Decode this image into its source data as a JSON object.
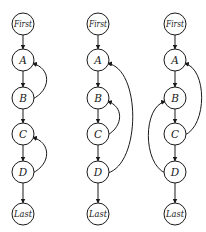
{
  "diagram": {
    "type": "control-flow-graphs",
    "colors": {
      "stroke": "#1a1a1a",
      "node_fill": "#ffffff",
      "background": "#ffffff"
    },
    "node_radius": 11,
    "graphs": [
      {
        "id": "graph-1",
        "cx": 23,
        "nodes": [
          {
            "id": "first",
            "label": "First",
            "y": 24
          },
          {
            "id": "a",
            "label": "A",
            "y": 60
          },
          {
            "id": "b",
            "label": "B",
            "y": 98
          },
          {
            "id": "c",
            "label": "C",
            "y": 134
          },
          {
            "id": "d",
            "label": "D",
            "y": 172
          },
          {
            "id": "last",
            "label": "Last",
            "y": 214
          }
        ],
        "forward_edges": [
          [
            "first",
            "a"
          ],
          [
            "a",
            "b"
          ],
          [
            "b",
            "c"
          ],
          [
            "c",
            "d"
          ],
          [
            "d",
            "last"
          ]
        ],
        "back_edges": [
          {
            "from": "b",
            "to": "a",
            "side": "right",
            "bulge": 21
          },
          {
            "from": "d",
            "to": "c",
            "side": "right",
            "bulge": 21
          }
        ]
      },
      {
        "id": "graph-2",
        "cx": 98,
        "nodes": [
          {
            "id": "first",
            "label": "First",
            "y": 24
          },
          {
            "id": "a",
            "label": "A",
            "y": 60
          },
          {
            "id": "b",
            "label": "B",
            "y": 98
          },
          {
            "id": "c",
            "label": "C",
            "y": 134
          },
          {
            "id": "d",
            "label": "D",
            "y": 172
          },
          {
            "id": "last",
            "label": "Last",
            "y": 214
          }
        ],
        "forward_edges": [
          [
            "first",
            "a"
          ],
          [
            "a",
            "b"
          ],
          [
            "b",
            "c"
          ],
          [
            "c",
            "d"
          ],
          [
            "d",
            "last"
          ]
        ],
        "back_edges": [
          {
            "from": "c",
            "to": "b",
            "side": "right",
            "bulge": 19
          },
          {
            "from": "d",
            "to": "a",
            "side": "right",
            "bulge": 32
          }
        ]
      },
      {
        "id": "graph-3",
        "cx": 175,
        "nodes": [
          {
            "id": "first",
            "label": "First",
            "y": 24
          },
          {
            "id": "a",
            "label": "A",
            "y": 60
          },
          {
            "id": "b",
            "label": "B",
            "y": 98
          },
          {
            "id": "c",
            "label": "C",
            "y": 134
          },
          {
            "id": "d",
            "label": "D",
            "y": 172
          },
          {
            "id": "last",
            "label": "Last",
            "y": 214
          }
        ],
        "forward_edges": [
          [
            "first",
            "a"
          ],
          [
            "a",
            "b"
          ],
          [
            "b",
            "c"
          ],
          [
            "c",
            "d"
          ],
          [
            "d",
            "last"
          ]
        ],
        "back_edges": [
          {
            "from": "c",
            "to": "a",
            "side": "right",
            "bulge": 24
          },
          {
            "from": "d",
            "to": "b",
            "side": "left",
            "bulge": 24
          }
        ]
      }
    ]
  }
}
